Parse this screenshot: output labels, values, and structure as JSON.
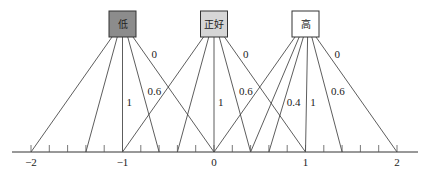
{
  "nodes": [
    {
      "id": "low",
      "label": "低",
      "x": -1,
      "fill": "#8c8c8c"
    },
    {
      "id": "just_right",
      "label": "正好",
      "x": 0,
      "fill": "#d6d6d6"
    },
    {
      "id": "high",
      "label": "高",
      "x": 1,
      "fill": "#ffffff"
    }
  ],
  "axis": {
    "ticks": [
      "−2",
      "−1",
      "0",
      "1",
      "2"
    ],
    "min": -2,
    "max": 2,
    "minor_step": 0.2
  },
  "edges": [
    {
      "from": "low",
      "to": -2,
      "label": ""
    },
    {
      "from": "low",
      "to": -1.4,
      "label": ""
    },
    {
      "from": "low",
      "to": -1,
      "label": "1"
    },
    {
      "from": "low",
      "to": -0.6,
      "label": "0.6"
    },
    {
      "from": "low",
      "to": 0,
      "label": "0"
    },
    {
      "from": "just_right",
      "to": -1,
      "label": ""
    },
    {
      "from": "just_right",
      "to": -0.4,
      "label": ""
    },
    {
      "from": "just_right",
      "to": 0,
      "label": "1"
    },
    {
      "from": "just_right",
      "to": 0.4,
      "label": "0.6"
    },
    {
      "from": "just_right",
      "to": 1,
      "label": "0"
    },
    {
      "from": "high",
      "to": 0,
      "label": ""
    },
    {
      "from": "high",
      "to": 0.4,
      "label": ""
    },
    {
      "from": "high",
      "to": 0.6,
      "label": "0.4"
    },
    {
      "from": "high",
      "to": 1,
      "label": "1"
    },
    {
      "from": "high",
      "to": 1.4,
      "label": "0.6"
    },
    {
      "from": "high",
      "to": 2,
      "label": "0"
    }
  ]
}
